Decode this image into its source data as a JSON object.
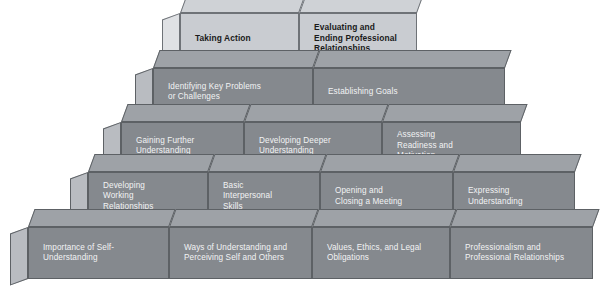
{
  "diagram": {
    "colors": {
      "dark_block_face": "#85898e",
      "dark_block_side": "#b9bcc1",
      "dark_block_top": "#9ea2a7",
      "light_block_face": "#c9ccd1",
      "light_block_side": "#dfe1e4",
      "light_block_top": "#cfd2d6",
      "edge": "#6a6f74",
      "dark_text": "#1a1a1a",
      "light_text": "#f2f3f4",
      "background": "#ffffff"
    },
    "levels": [
      {
        "number": "5",
        "style": "light",
        "blocks": [
          {
            "lines": [
              "Taking Action"
            ],
            "align": "center"
          },
          {
            "lines": [
              "Evaluating and",
              "Ending Professional",
              "Relationships"
            ],
            "align": "left"
          }
        ]
      },
      {
        "number": "4",
        "style": "dark",
        "blocks": [
          {
            "lines": [
              "Identifying Key Problems",
              "or Challenges"
            ],
            "align": "left"
          },
          {
            "lines": [
              "Establishing Goals"
            ],
            "align": "center"
          }
        ]
      },
      {
        "number": "3",
        "style": "dark",
        "blocks": [
          {
            "lines": [
              "Gaining Further",
              "Understanding"
            ],
            "align": "left"
          },
          {
            "lines": [
              "Developing Deeper",
              "Understanding"
            ],
            "align": "left"
          },
          {
            "lines": [
              "Assessing",
              "Readiness and",
              "Motivation"
            ],
            "align": "left"
          }
        ]
      },
      {
        "number": "2",
        "style": "dark",
        "blocks": [
          {
            "lines": [
              "Developing",
              "Working",
              "Relationships"
            ],
            "align": "left"
          },
          {
            "lines": [
              "Basic",
              "Interpersonal",
              "Skills"
            ],
            "align": "left"
          },
          {
            "lines": [
              "Opening and",
              "Closing a Meeting"
            ],
            "align": "left"
          },
          {
            "lines": [
              "Expressing",
              "Understanding"
            ],
            "align": "left"
          }
        ]
      },
      {
        "number": "1",
        "style": "dark",
        "blocks": [
          {
            "lines": [
              "Importance of Self-",
              "Understanding"
            ],
            "align": "left"
          },
          {
            "lines": [
              "Ways of Understanding and",
              "Perceiving Self and Others"
            ],
            "align": "left"
          },
          {
            "lines": [
              "Values, Ethics, and Legal",
              "Obligations"
            ],
            "align": "left"
          },
          {
            "lines": [
              "Professionalism and",
              "Professional Relationships"
            ],
            "align": "left"
          }
        ]
      }
    ]
  }
}
